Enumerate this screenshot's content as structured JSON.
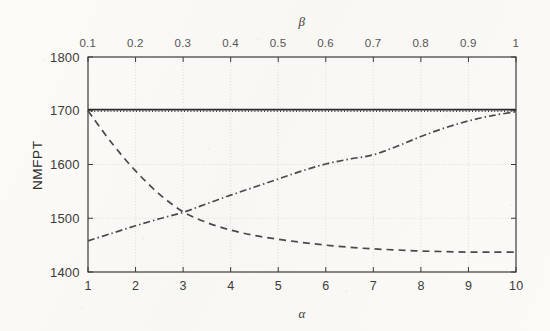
{
  "figure": {
    "kind": "matlab-line-plot",
    "background_color": "#fbfaf7",
    "axis_color": "#3b3b3b",
    "grid_color": "#d8d6d0"
  },
  "axes": {
    "y_title": "NMFPT",
    "x_bottom_title": "α",
    "x_top_title": "β"
  },
  "chart_data": {
    "type": "line",
    "title": "",
    "xlabel": "α",
    "ylabel": "NMFPT",
    "x2label": "β",
    "xlim": [
      1,
      10
    ],
    "ylim": [
      1400,
      1800
    ],
    "x2lim": [
      0.1,
      1
    ],
    "grid": true,
    "legend_position": "none",
    "xticks": [
      1,
      2,
      3,
      4,
      5,
      6,
      7,
      8,
      9,
      10
    ],
    "xticklabels": [
      "1",
      "2",
      "3",
      "4",
      "5",
      "6",
      "7",
      "8",
      "9",
      "10"
    ],
    "x2ticks": [
      0.1,
      0.2,
      0.3,
      0.4,
      0.5,
      0.6,
      0.7,
      0.8,
      0.9,
      1
    ],
    "x2ticklabels": [
      "0.1",
      "0.2",
      "0.3",
      "0.4",
      "0.5",
      "0.6",
      "0.7",
      "0.8",
      "0.9",
      "1"
    ],
    "yticks": [
      1400,
      1500,
      1600,
      1700,
      1800
    ],
    "yticklabels": [
      "1400",
      "1500",
      "1600",
      "1700",
      "1800"
    ],
    "x": [
      1,
      1.5,
      2,
      2.5,
      3,
      3.5,
      4,
      4.5,
      5,
      5.5,
      6,
      6.5,
      7,
      7.5,
      8,
      8.5,
      9,
      9.5,
      10
    ],
    "series": [
      {
        "name": "constant-solid",
        "style": "solid",
        "color": "#2b2b2b",
        "width": 1.8,
        "values": [
          1702,
          1702,
          1702,
          1702,
          1702,
          1702,
          1702,
          1702,
          1702,
          1702,
          1702,
          1702,
          1702,
          1702,
          1702,
          1702,
          1702,
          1702,
          1702
        ]
      },
      {
        "name": "constant-dotted",
        "style": "dotted",
        "color": "#3a3a3a",
        "width": 1.6,
        "values": [
          1699,
          1699,
          1699,
          1699,
          1699,
          1699,
          1699,
          1699,
          1699,
          1699,
          1699,
          1699,
          1699,
          1699,
          1699,
          1699,
          1699,
          1699,
          1699
        ]
      },
      {
        "name": "decreasing-dashed",
        "style": "dashed",
        "color": "#4a4a4a",
        "width": 1.7,
        "values": [
          1700,
          1640,
          1588,
          1545,
          1512,
          1492,
          1478,
          1468,
          1461,
          1455,
          1450,
          1446,
          1443,
          1441,
          1439,
          1438,
          1437,
          1437,
          1437
        ]
      },
      {
        "name": "increasing-dashdot",
        "style": "dashdot",
        "color": "#4a4a4a",
        "width": 1.7,
        "values": [
          1458,
          1472,
          1486,
          1499,
          1511,
          1527,
          1543,
          1558,
          1573,
          1588,
          1601,
          1610,
          1618,
          1634,
          1652,
          1668,
          1681,
          1691,
          1698
        ]
      }
    ]
  }
}
